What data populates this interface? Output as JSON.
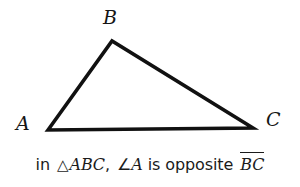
{
  "figure": {
    "background_color": "#ffffff",
    "stroke_color": "#111111",
    "stroke_width": 3.6,
    "vertices": [
      {
        "name": "A",
        "label": "A",
        "x": 48,
        "y": 130
      },
      {
        "name": "B",
        "label": "B",
        "x": 112,
        "y": 41
      },
      {
        "name": "C",
        "label": "C",
        "x": 253,
        "y": 128
      }
    ],
    "edges": [
      {
        "name": "AB",
        "from": "A",
        "to": "B"
      },
      {
        "name": "BC",
        "from": "B",
        "to": "C"
      },
      {
        "name": "CA",
        "from": "C",
        "to": "A"
      }
    ]
  },
  "caption": {
    "full_text": "in △ABC, ∠A is opposite BC",
    "lead_word": "in",
    "triangle_symbol": "△",
    "triangle_name": "ABC",
    "comma": ",",
    "angle_symbol": "∠",
    "angle_vertex": "A",
    "relation_text": "is opposite",
    "segment_label": "BC",
    "segment_has_overline": true,
    "text_color": "#1b1b1b"
  }
}
